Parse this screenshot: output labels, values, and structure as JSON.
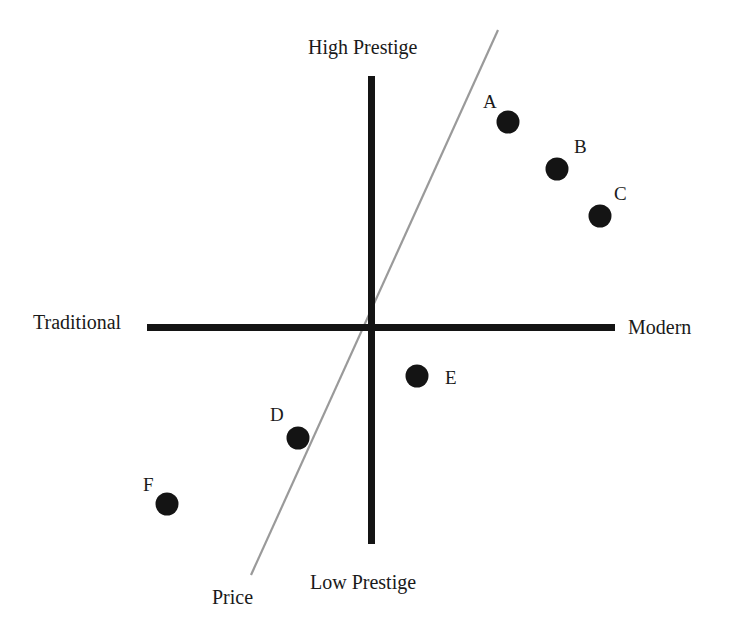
{
  "diagram": {
    "type": "perceptual-map",
    "axes": {
      "top": "High Prestige",
      "bottom": "Low Prestige",
      "left": "Traditional",
      "right": "Modern"
    },
    "price_line": {
      "label": "Price",
      "color": "#9a9a9a"
    },
    "points": [
      {
        "id": "A",
        "label": "A",
        "x": 508,
        "y": 122
      },
      {
        "id": "B",
        "label": "B",
        "x": 557,
        "y": 169
      },
      {
        "id": "C",
        "label": "C",
        "x": 600,
        "y": 216
      },
      {
        "id": "D",
        "label": "D",
        "x": 298,
        "y": 438
      },
      {
        "id": "E",
        "label": "E",
        "x": 417,
        "y": 376
      },
      {
        "id": "F",
        "label": "F",
        "x": 167,
        "y": 504
      }
    ],
    "colors": {
      "axis": "#141414",
      "point": "#141414",
      "background": "#ffffff"
    }
  }
}
